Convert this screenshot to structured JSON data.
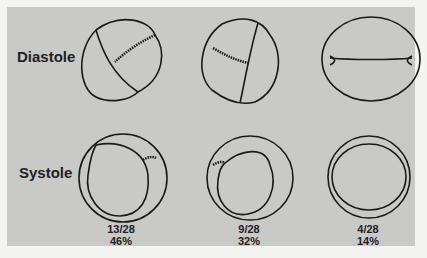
{
  "rows": [
    {
      "label": "Diastole"
    },
    {
      "label": "Systole"
    }
  ],
  "columns": [
    {
      "fraction": "13/28",
      "percent": "46%"
    },
    {
      "fraction": "9/28",
      "percent": "32%"
    },
    {
      "fraction": "4/28",
      "percent": "14%"
    }
  ],
  "colors": {
    "background": "#c9c9c7",
    "line": "#1a1a1a",
    "border": "#f4f4f2"
  }
}
